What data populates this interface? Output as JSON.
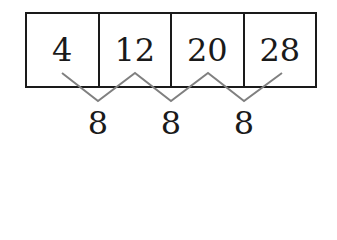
{
  "diagram": {
    "sequence": [
      "4",
      "12",
      "20",
      "28"
    ],
    "differences": [
      "8",
      "8",
      "8"
    ],
    "colors": {
      "box_stroke": "#1a1a1a",
      "zigzag_stroke": "#808080",
      "text": "#1a1a1a"
    }
  }
}
